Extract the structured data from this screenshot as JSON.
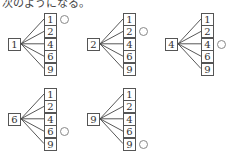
{
  "caption": "次のようになる。",
  "trees": [
    {
      "root": "1",
      "leaves": [
        "1",
        "2",
        "4",
        "6",
        "9"
      ],
      "marked_index": 0
    },
    {
      "root": "2",
      "leaves": [
        "1",
        "2",
        "4",
        "6",
        "9"
      ],
      "marked_index": 1
    },
    {
      "root": "4",
      "leaves": [
        "1",
        "2",
        "4",
        "6",
        "9"
      ],
      "marked_index": 2
    },
    {
      "root": "6",
      "leaves": [
        "1",
        "2",
        "4",
        "6",
        "9"
      ],
      "marked_index": 3
    },
    {
      "root": "9",
      "leaves": [
        "1",
        "2",
        "4",
        "6",
        "9"
      ],
      "marked_index": 4
    }
  ],
  "mark_symbol": "circle"
}
